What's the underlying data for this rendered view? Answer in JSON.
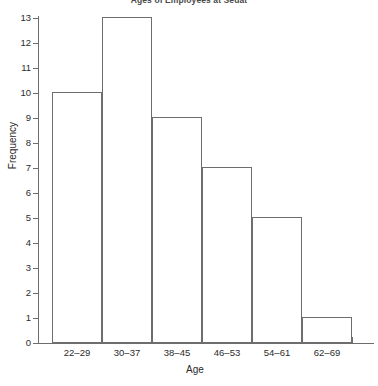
{
  "chart_data": {
    "type": "bar",
    "title": "Ages of Employees at Sedat",
    "xlabel": "Age",
    "ylabel": "Frequency",
    "categories": [
      "22–29",
      "30–37",
      "38–45",
      "46–53",
      "54–61",
      "62–69"
    ],
    "values": [
      10,
      13,
      9,
      7,
      5,
      1
    ],
    "ylim": [
      0,
      13
    ],
    "yticks": [
      0,
      1,
      2,
      3,
      4,
      5,
      6,
      7,
      8,
      9,
      10,
      11,
      12,
      13
    ],
    "ytick_labels": [
      "0",
      "1",
      "2",
      "3",
      "4",
      "5",
      "6",
      "7",
      "8",
      "9",
      "10",
      "11",
      "12",
      "13"
    ],
    "grid": false,
    "legend": null,
    "bar_style": "outline",
    "bar_edge_color": "#6d6d6d",
    "bar_fill_color": "#ffffff",
    "axis_color": "#6d6d6d",
    "text_color": "#2b2b2b",
    "background_color": "#ffffff"
  }
}
